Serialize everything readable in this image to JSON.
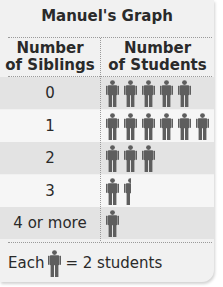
{
  "title": "Manuel's Graph",
  "headers": {
    "left_line1": "Number",
    "left_line2": "of Siblings",
    "right_line1": "Number",
    "right_line2": "of Students"
  },
  "rows": [
    {
      "label": "0",
      "icons": 5,
      "students": 10
    },
    {
      "label": "1",
      "icons": 6,
      "students": 12
    },
    {
      "label": "2",
      "icons": 3,
      "students": 6
    },
    {
      "label": "3",
      "icons": 1.5,
      "students": 3
    },
    {
      "label": "4 or more",
      "icons": 1,
      "students": 2
    }
  ],
  "key": {
    "prefix": "Each",
    "suffix": "= 2 students",
    "icon": "person-icon",
    "value_per_icon": 2
  },
  "colors": {
    "icon": "#5e5e5e",
    "text": "#2a2a2a",
    "row_dark": "#e3e3e3",
    "row_light": "#f6f6f6"
  },
  "chart_data": {
    "type": "table",
    "subtype": "pictograph",
    "title": "Manuel's Graph",
    "xlabel": "Number of Siblings",
    "ylabel": "Number of Students",
    "categories": [
      "0",
      "1",
      "2",
      "3",
      "4 or more"
    ],
    "icon_counts": [
      5,
      6,
      3,
      1.5,
      1
    ],
    "values": [
      10,
      12,
      6,
      3,
      2
    ],
    "key": "Each icon = 2 students"
  }
}
